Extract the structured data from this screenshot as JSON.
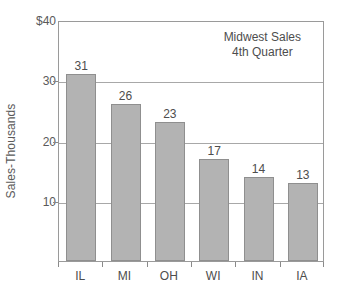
{
  "chart_data": {
    "type": "bar",
    "title": "",
    "annotation_lines": [
      "Midwest Sales",
      "4th Quarter"
    ],
    "categories": [
      "IL",
      "MI",
      "OH",
      "WI",
      "IN",
      "IA"
    ],
    "values": [
      31,
      26,
      23,
      17,
      14,
      13
    ],
    "xlabel": "",
    "ylabel": "Sales-Thousands",
    "ylim": [
      0,
      40
    ],
    "yticks": [
      10,
      20,
      30
    ],
    "ytick_labels": [
      "10",
      "20",
      "30"
    ],
    "y_top_label": "$40",
    "grid": true,
    "legend": false,
    "bar_color": "#b3b3b3",
    "bar_border_color": "#8f8f8f",
    "axis_color": "#9a9a9a",
    "text_color": "#4d4d4d"
  }
}
